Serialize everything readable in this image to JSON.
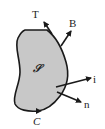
{
  "diagram": {
    "region_label": "𝒮",
    "boundary_label": "C",
    "vectors": [
      {
        "name": "T",
        "label": "T"
      },
      {
        "name": "B",
        "label": "B"
      },
      {
        "name": "i",
        "label": "i"
      },
      {
        "name": "n",
        "label": "n"
      }
    ],
    "colors": {
      "fill": "#c8c8c8",
      "stroke": "#1a1a1a",
      "background": "#ffffff"
    }
  }
}
